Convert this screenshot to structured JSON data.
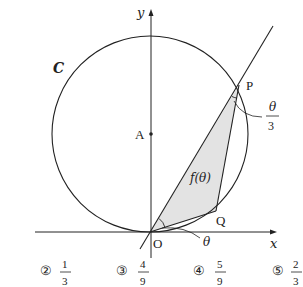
{
  "diagram": {
    "axes": {
      "x_label": "x",
      "y_label": "y",
      "origin_label": "O"
    },
    "circle": {
      "label": "C",
      "center_label": "A"
    },
    "points": {
      "P": "P",
      "Q": "Q"
    },
    "angles": {
      "at_O": "θ",
      "at_P_num": "θ",
      "at_P_den": "3"
    },
    "region_label": "f(θ)",
    "colors": {
      "stroke": "#222222",
      "fill": "#e3e3e3",
      "background": "#ffffff"
    }
  },
  "choices": [
    {
      "mark": "②",
      "num": "1",
      "den": "3"
    },
    {
      "mark": "③",
      "num": "4",
      "den": "9"
    },
    {
      "mark": "④",
      "num": "5",
      "den": "9"
    },
    {
      "mark": "⑤",
      "num": "2",
      "den": "3"
    }
  ]
}
